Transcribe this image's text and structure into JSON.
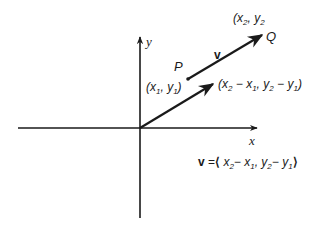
{
  "diagram": {
    "type": "vector-in-plane",
    "colors": {
      "stroke": "#1a1a1a",
      "background": "#ffffff"
    },
    "axes": {
      "x_label": "x",
      "y_label": "y"
    },
    "points": {
      "P": {
        "name": "P",
        "coords_label": "(x1, y1)"
      },
      "Q": {
        "name": "Q",
        "coords_label": "(x2, y2"
      }
    },
    "vectors": {
      "PQ": {
        "label": "v",
        "from": "P",
        "to": "Q"
      },
      "position": {
        "from": "origin",
        "tip_label": "(x2 − x1, y2 − y1)"
      }
    },
    "equation": "v = ⟨x2 − x1, y2 − y1⟩",
    "text": {
      "P": "P",
      "Q": "Q",
      "v": "v",
      "x": "x",
      "y": "y",
      "paren_open": "(",
      "paren_close": ")",
      "comma": ",",
      "x_var": "x",
      "y_var": "y",
      "sub1": "1",
      "sub2": "2",
      "minus": "−",
      "eq": "=",
      "langle": "⟨",
      "rangle": "⟩"
    }
  }
}
